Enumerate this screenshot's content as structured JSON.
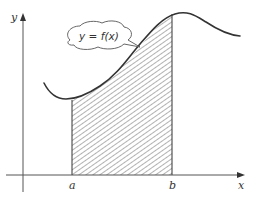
{
  "figure": {
    "curve_label": "y = f(x)",
    "axes": {
      "x_label": "x",
      "y_label": "y"
    },
    "bounds": {
      "lower": "a",
      "upper": "b"
    },
    "shaded_region": "area between curve and x-axis from a to b (hatched)",
    "colors": {
      "line": "#333333",
      "hatch": "#555555",
      "background": "#ffffff"
    }
  }
}
